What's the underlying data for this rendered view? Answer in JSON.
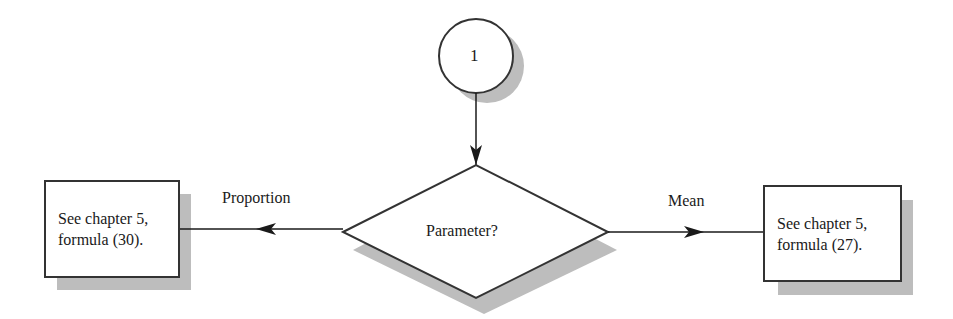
{
  "diagram": {
    "type": "flowchart",
    "connector": {
      "label": "1",
      "shape": "circle"
    },
    "decision": {
      "label": "Parameter?",
      "shape": "diamond"
    },
    "branches": [
      {
        "label": "Proportion",
        "direction": "left",
        "target": {
          "line1": "See chapter 5,",
          "line2": "formula (30)."
        }
      },
      {
        "label": "Mean",
        "direction": "right",
        "target": {
          "line1": "See chapter 5,",
          "line2": "formula (27)."
        }
      }
    ],
    "colors": {
      "stroke": "#333333",
      "shadow": "#bdbdbd",
      "fill": "#ffffff"
    }
  }
}
